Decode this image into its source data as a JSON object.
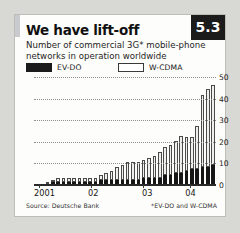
{
  "badge": {
    "label": "5.3"
  },
  "header": {
    "title": "We have lift-off",
    "subtitle": "Number of commercial 3G* mobile-phone networks in operation worldwide"
  },
  "legend": {
    "items": [
      {
        "label": "EV-DO",
        "color": "#161616",
        "style": "filled"
      },
      {
        "label": "W-CDMA",
        "color": "#efefed",
        "style": "outlined"
      }
    ]
  },
  "footer": {
    "source": "Source: Deutsche Bank",
    "footnote": "*EV-DO and W-CDMA"
  },
  "chart_data": {
    "type": "bar",
    "stacked": true,
    "title": "We have lift-off",
    "subtitle": "Number of commercial 3G* mobile-phone networks in operation worldwide",
    "xlabel": "",
    "ylabel": "",
    "ylim": [
      0,
      50
    ],
    "yticks": [
      0,
      10,
      20,
      30,
      40,
      50
    ],
    "grid": true,
    "legend_position": "top",
    "x_axis_labels": [
      "2001",
      "02",
      "03",
      "04"
    ],
    "x_label_positions": [
      0,
      0.3,
      0.6,
      0.84
    ],
    "x_tick_positions": [
      0.02,
      0.31,
      0.6,
      0.86
    ],
    "categories": [
      "2001 Q1",
      "2001 Q2",
      "2001 Q3",
      "2001 Q4",
      "2002 Q1",
      "2002 Q2",
      "2002 Q3",
      "2002 Q4",
      "2002 Q5",
      "2002 Q6",
      "2002 Q7",
      "2002 Q8",
      "2003 Q1",
      "2003 Q2",
      "2003 Q3",
      "2003 Q4",
      "2003 Q5",
      "2003 Q6",
      "2003 Q7",
      "2003 Q8",
      "2004 Q1",
      "2004 Q2",
      "2004 Q3",
      "2004 Q4",
      "2004 Q5",
      "2004 Q6",
      "2004 Q7",
      "2004 Q8",
      "2004 Q9",
      "2004 Q10",
      "2004 Q11",
      "2004 Q12",
      "2004 Q13",
      "2004 Q14"
    ],
    "series": [
      {
        "name": "EV-DO",
        "color": "#161616",
        "values": [
          0,
          0,
          0,
          1,
          1,
          1,
          1,
          1,
          1,
          1,
          1,
          1,
          2,
          2,
          2,
          2,
          2,
          2,
          2,
          2,
          3,
          3,
          3,
          3,
          4,
          4,
          5,
          5,
          6,
          7,
          7,
          8,
          8,
          9
        ]
      },
      {
        "name": "W-CDMA",
        "color": "#efefed",
        "values": [
          0,
          0,
          1,
          1,
          2,
          2,
          2,
          2,
          2,
          2,
          2,
          2,
          2,
          3,
          4,
          6,
          7,
          8,
          8,
          8,
          8,
          9,
          10,
          12,
          13,
          14,
          15,
          17,
          16,
          15,
          20,
          33,
          36,
          37
        ]
      }
    ],
    "totals": [
      0,
      0,
      1,
      2,
      3,
      3,
      3,
      3,
      3,
      3,
      3,
      3,
      4,
      5,
      6,
      8,
      9,
      10,
      10,
      10,
      11,
      12,
      13,
      15,
      17,
      18,
      20,
      22,
      22,
      22,
      27,
      41,
      44,
      46
    ]
  }
}
